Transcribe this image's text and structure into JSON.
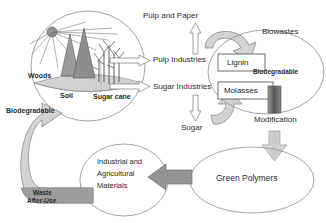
{
  "diagram": {
    "nodes": {
      "ecosystem": {
        "sun": "sun-icon",
        "woods": "Woods",
        "soil": "Soil",
        "sugar_cane": "Sugar cane",
        "biodegradable_left": "Biodegradable"
      },
      "pulp_and_paper": "Pulp and Paper",
      "pulp_industries": "Pulp Industries",
      "sugar_industries": "Sugar Industries",
      "sugar": "Sugar",
      "lignin": "Lignin",
      "molasses": "Molasses",
      "biowastes": "Biowastes",
      "biodegradable_right": "Biodegradable",
      "modification": "Modification",
      "green_polymers": "Green Polymers",
      "industrial_materials": "Industrial and\nAgricultural\nMaterials",
      "industrial_materials_line1": "Industrial and",
      "industrial_materials_line2": "Agricultural",
      "industrial_materials_line3": "Materials",
      "waste_after_use_line1": "Waste",
      "waste_after_use_line2": "After-Use"
    },
    "colors": {
      "outline": "#6f6f6f",
      "arrow_light": "#d6d6d6",
      "arrow_mid": "#b8b8b8",
      "arrow_dark": "#6a6a6a",
      "text": "#222222",
      "soil_fill": "#cfcfcf"
    }
  }
}
